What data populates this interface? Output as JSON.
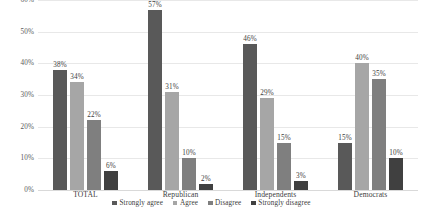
{
  "chart_data": {
    "type": "bar",
    "title": "",
    "subtitle": "",
    "xlabel": "",
    "ylabel": "",
    "ylim": [
      0,
      60
    ],
    "ytick_labels": [
      "60%",
      "50%",
      "40%",
      "30%",
      "20%",
      "10%",
      "0%"
    ],
    "ytick_values": [
      60,
      50,
      40,
      30,
      20,
      10,
      0
    ],
    "grid": true,
    "legend_position": "bottom",
    "value_suffix": "%",
    "categories": [
      "TOTAL",
      "Republican",
      "Independents",
      "Democrats"
    ],
    "series": [
      {
        "name": "Strongly agree",
        "color": "#595959",
        "values": [
          38,
          57,
          46,
          15
        ],
        "labels": [
          "38%",
          "57%",
          "46%",
          "15%"
        ]
      },
      {
        "name": "Agree",
        "color": "#a6a6a6",
        "values": [
          34,
          31,
          29,
          40
        ],
        "labels": [
          "34%",
          "31%",
          "29%",
          "40%"
        ]
      },
      {
        "name": "Disagree",
        "color": "#7f7f7f",
        "values": [
          22,
          10,
          15,
          35
        ],
        "labels": [
          "22%",
          "10%",
          "15%",
          "35%"
        ]
      },
      {
        "name": "Strongly disagree",
        "color": "#404040",
        "values": [
          6,
          2,
          3,
          10
        ],
        "labels": [
          "6%",
          "2%",
          "3%",
          "10%"
        ]
      }
    ]
  }
}
